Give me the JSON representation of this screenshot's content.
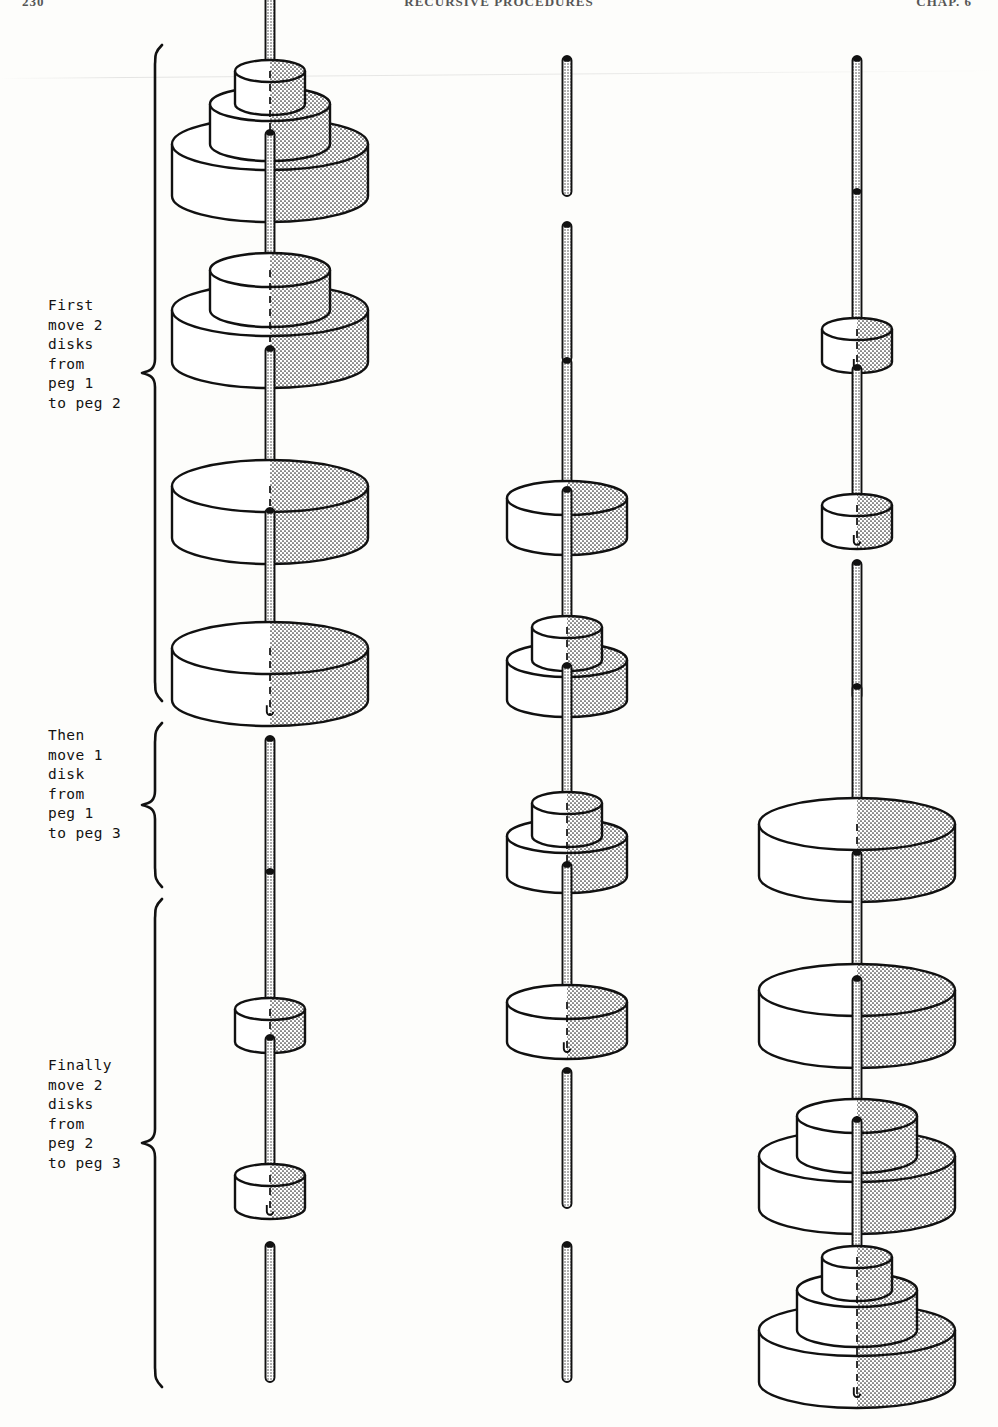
{
  "page": {
    "folio": "230",
    "running_title": "RECURSIVE PROCEDURES",
    "chapter_mark": "CHAP. 6",
    "figure_kind": "tower-of-hanoi-move-sequence"
  },
  "labels": [
    {
      "id": "first-group",
      "lines": [
        "First",
        "move 2",
        "disks",
        "from",
        "peg 1",
        "to peg 2"
      ],
      "text": "First\nmove 2\ndisks\nfrom\npeg 1\nto peg 2",
      "x": 48,
      "y": 296,
      "brace": {
        "x": 140,
        "y": 44,
        "height": 658
      }
    },
    {
      "id": "then-group",
      "lines": [
        "Then",
        "move 1",
        "disk",
        "from",
        "peg 1",
        "to peg 3"
      ],
      "text": "Then\nmove 1\ndisk\nfrom\npeg 1\nto peg 3",
      "x": 48,
      "y": 726,
      "brace": {
        "x": 140,
        "y": 722,
        "height": 166
      }
    },
    {
      "id": "finally-group",
      "lines": [
        "Finally",
        "move 2",
        "disks",
        "from",
        "peg 2",
        "to peg 3"
      ],
      "text": "Finally\nmove 2\ndisks\nfrom\npeg 2\nto peg 3",
      "x": 48,
      "y": 1056,
      "brace": {
        "x": 140,
        "y": 898,
        "height": 490
      }
    }
  ],
  "geometry": {
    "peg_x": [
      270,
      567,
      857
    ],
    "row_baseline_y": [
      196,
      362,
      538,
      700,
      876,
      1042,
      1208,
      1382
    ],
    "row_step": 166,
    "disk_sizes": {
      "large": {
        "width": 196,
        "side": 52,
        "ry": 26
      },
      "medium": {
        "width": 120,
        "side": 40,
        "ry": 17
      },
      "small": {
        "width": 70,
        "side": 33,
        "ry": 11
      }
    },
    "peg_height": 140,
    "peg_width": 9
  },
  "states": [
    {
      "row": 1,
      "pegs": [
        [
          "large",
          "medium",
          "small"
        ],
        [],
        []
      ]
    },
    {
      "row": 2,
      "pegs": [
        [
          "large",
          "medium"
        ],
        [],
        [
          "small"
        ]
      ]
    },
    {
      "row": 3,
      "pegs": [
        [
          "large"
        ],
        [
          "medium"
        ],
        [
          "small"
        ]
      ]
    },
    {
      "row": 4,
      "pegs": [
        [
          "large"
        ],
        [
          "medium",
          "small"
        ],
        []
      ]
    },
    {
      "row": 5,
      "pegs": [
        [],
        [
          "medium",
          "small"
        ],
        [
          "large"
        ]
      ]
    },
    {
      "row": 6,
      "pegs": [
        [
          "small"
        ],
        [
          "medium"
        ],
        [
          "large"
        ]
      ]
    },
    {
      "row": 7,
      "pegs": [
        [
          "small"
        ],
        [],
        [
          "large",
          "medium"
        ]
      ]
    },
    {
      "row": 8,
      "pegs": [
        [],
        [],
        [
          "large",
          "medium",
          "small"
        ]
      ]
    }
  ],
  "colors": {
    "ink": "#111111",
    "paper": "#fdfdfb",
    "stipple": "#2b2b2b",
    "disk_fill": "#ffffff"
  }
}
